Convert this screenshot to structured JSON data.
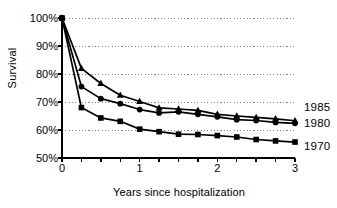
{
  "chart_data": {
    "type": "line",
    "title": "",
    "xlabel": "Years since hospitalization",
    "ylabel": "Survival",
    "xlim": [
      0,
      3
    ],
    "ylim": [
      50,
      100
    ],
    "grid": true,
    "legend_position": "right-inline",
    "x_ticks": [
      "0",
      "1",
      "2",
      "3"
    ],
    "x_tick_values": [
      0,
      1,
      2,
      3
    ],
    "x_minor_tick_step": 0.25,
    "y_ticks": [
      "50%",
      "60%",
      "70%",
      "80%",
      "90%",
      "100%"
    ],
    "y_tick_values": [
      50,
      60,
      70,
      80,
      90,
      100
    ],
    "x": [
      0,
      0.25,
      0.5,
      0.75,
      1,
      1.25,
      1.5,
      1.75,
      2,
      2.25,
      2.5,
      2.75,
      3
    ],
    "series": [
      {
        "name": "1985",
        "marker": "triangle",
        "values": [
          100,
          82.0,
          76.6,
          72.4,
          70.2,
          67.9,
          67.5,
          67.0,
          65.6,
          65.0,
          64.5,
          64.0,
          63.3
        ]
      },
      {
        "name": "1980",
        "marker": "circle",
        "values": [
          100,
          75.5,
          71.2,
          69.4,
          67.3,
          66.1,
          66.5,
          65.6,
          64.7,
          63.7,
          63.4,
          62.7,
          62.4
        ]
      },
      {
        "name": "1970",
        "marker": "square",
        "values": [
          100,
          68.0,
          64.3,
          63.1,
          60.3,
          59.4,
          58.5,
          58.4,
          58.0,
          57.5,
          56.6,
          56.1,
          55.7
        ]
      }
    ],
    "colors": {
      "line": "#000000",
      "grid": "#808080",
      "axis": "#000000",
      "background": "#ffffff"
    }
  }
}
